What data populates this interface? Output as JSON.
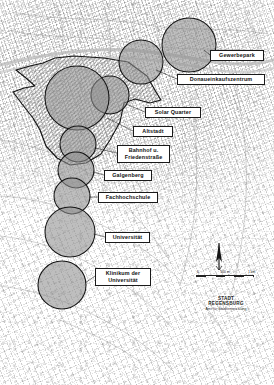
{
  "map": {
    "title": "Regensburg – Potenzialräume / Entwicklungsschwerpunkte",
    "width": 274,
    "height": 385,
    "colors": {
      "circle_fill": "#8f8f8f",
      "circle_stroke": "#1a1a1a",
      "polygon_stroke": "#1a1a1a",
      "polygon_hatch": "#7a7a7a",
      "label_bg": "#ffffff",
      "label_border": "#1a1a1a",
      "label_text": "#111111",
      "basemap": "#ffffff"
    },
    "labels": [
      {
        "id": "gewerbepark",
        "text": "Gewerbepark",
        "x": 210,
        "y": 50,
        "w": 54,
        "h": 10
      },
      {
        "id": "donaueinkaufszentrum",
        "text": "Donaueinkaufszentrum",
        "x": 177,
        "y": 74,
        "w": 88,
        "h": 10
      },
      {
        "id": "solar-quarter",
        "text": "Solar Quarter",
        "x": 145,
        "y": 107,
        "w": 56,
        "h": 10
      },
      {
        "id": "altstadt",
        "text": "Altstadt",
        "x": 133,
        "y": 126,
        "w": 40,
        "h": 10
      },
      {
        "id": "bahnhof-friedenstrasse",
        "text": "Bahnhof u.\nFriedenstraße",
        "x": 117,
        "y": 145,
        "w": 53,
        "h": 17
      },
      {
        "id": "galgenberg",
        "text": "Galgenberg",
        "x": 104,
        "y": 170,
        "w": 48,
        "h": 10
      },
      {
        "id": "fachhochschule",
        "text": "Fachhochschule",
        "x": 98,
        "y": 192,
        "w": 60,
        "h": 10
      },
      {
        "id": "universitaet",
        "text": "Universität",
        "x": 105,
        "y": 232,
        "w": 45,
        "h": 10
      },
      {
        "id": "klinikum-universitaet",
        "text": "Klinikum der\nUniversität",
        "x": 95,
        "y": 268,
        "w": 56,
        "h": 17
      }
    ],
    "circles": [
      {
        "id": "gewerbepark-circle",
        "cx": 189,
        "cy": 45,
        "r": 27
      },
      {
        "id": "donaueinkaufszentrum-circle",
        "cx": 141,
        "cy": 62,
        "r": 22
      },
      {
        "id": "solar-quarter-circle",
        "cx": 110,
        "cy": 95,
        "r": 19
      },
      {
        "id": "altstadt-circle",
        "cx": 77,
        "cy": 98,
        "r": 32
      },
      {
        "id": "bahnhof-circle",
        "cx": 78,
        "cy": 144,
        "r": 18
      },
      {
        "id": "galgenberg-circle",
        "cx": 76,
        "cy": 170,
        "r": 18
      },
      {
        "id": "fachhochschule-circle",
        "cx": 72,
        "cy": 196,
        "r": 18
      },
      {
        "id": "universitaet-circle",
        "cx": 70,
        "cy": 232,
        "r": 25
      },
      {
        "id": "klinikum-circle",
        "cx": 62,
        "cy": 285,
        "r": 24
      }
    ],
    "potential_area": {
      "name": "Entwicklungsband / Potenzialfläche",
      "points": "43,63 55,58 74,56 104,58 128,62 147,76 156,92 161,100 150,103 135,99 124,103 120,122 110,140 101,154 86,163 70,165 57,158 46,146 40,130 33,118 22,104 13,92 24,88 35,86 26,78 16,70 30,66"
    },
    "north_arrow": {
      "id": "north-arrow",
      "x": 219,
      "y": 242,
      "label": "N"
    },
    "scalebar": {
      "id": "scale-bar",
      "x": 196,
      "y": 272,
      "w": 58,
      "ticks": [
        "0",
        "500 m",
        "1 km"
      ],
      "segments": 6
    },
    "credit": {
      "x": 200,
      "y": 296,
      "title": "STADT REGENSBURG",
      "subtitle": "Amt für Stadtentwicklung"
    }
  }
}
